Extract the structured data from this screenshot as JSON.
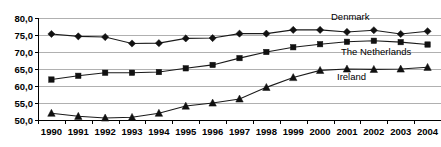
{
  "chart_data": {
    "type": "line",
    "title": "",
    "subtitle": "",
    "xlabel": "",
    "ylabel": "",
    "categories": [
      "1990",
      "1991",
      "1992",
      "1993",
      "1994",
      "1995",
      "1996",
      "1997",
      "1998",
      "1999",
      "2000",
      "2001",
      "2002",
      "2003",
      "2004"
    ],
    "x_tick_labels": [
      "1990",
      "1991",
      "1992",
      "1993",
      "1994",
      "1995",
      "1996",
      "1997",
      "1998",
      "1999",
      "2000",
      "2001",
      "2002",
      "2003",
      "2004"
    ],
    "y_tick_labels": [
      "50,0",
      "55,0",
      "60,0",
      "65,0",
      "70,0",
      "75,0",
      "80,0"
    ],
    "y_tick_values": [
      50.0,
      55.0,
      60.0,
      65.0,
      70.0,
      75.0,
      80.0
    ],
    "ylim": [
      50.0,
      80.0
    ],
    "grid": true,
    "grid_axis": "y",
    "legend": "inline-series-labels",
    "legend_position": "right-inline",
    "series": [
      {
        "name": "Denmark",
        "marker": "diamond",
        "color": "#111111",
        "label_text": "Denmark",
        "values": [
          75.3,
          74.6,
          74.4,
          72.5,
          72.6,
          74.0,
          74.1,
          75.4,
          75.4,
          76.5,
          76.5,
          75.9,
          76.4,
          75.3,
          76.1
        ]
      },
      {
        "name": "The Netherlands",
        "marker": "square",
        "color": "#111111",
        "label_text": "The Netherlands",
        "values": [
          61.9,
          63.0,
          63.9,
          63.9,
          64.1,
          65.2,
          66.2,
          68.2,
          70.0,
          71.4,
          72.3,
          73.0,
          73.3,
          72.9,
          72.2
        ]
      },
      {
        "name": "Ireland",
        "marker": "triangle",
        "color": "#111111",
        "label_text": "Ireland",
        "values": [
          52.0,
          51.1,
          50.6,
          50.8,
          52.0,
          54.1,
          55.0,
          56.2,
          59.6,
          62.5,
          64.6,
          65.0,
          64.9,
          65.0,
          65.5
        ]
      }
    ],
    "annotations": [
      {
        "text": "Denmark",
        "series": "Denmark"
      },
      {
        "text": "The Netherlands",
        "series": "The Netherlands"
      },
      {
        "text": "Ireland",
        "series": "Ireland"
      }
    ]
  }
}
